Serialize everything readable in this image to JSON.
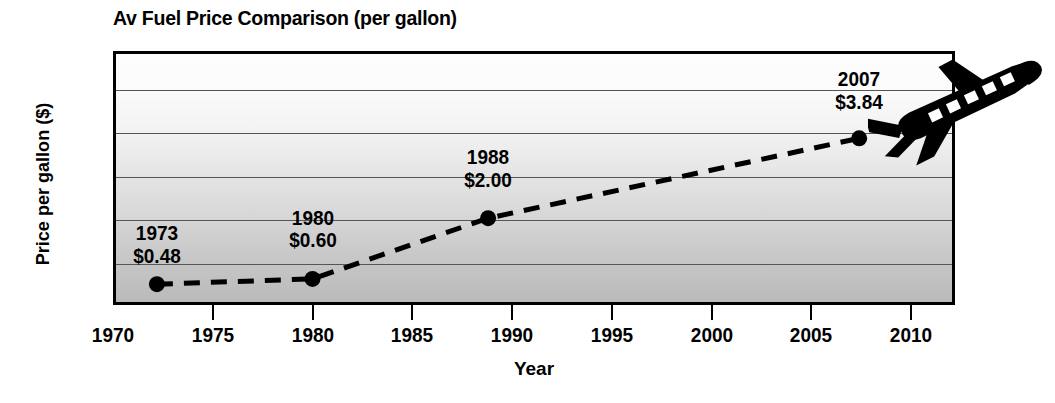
{
  "chart_data": {
    "type": "line",
    "title": "Av Fuel Price Comparison (per gallon)",
    "xlabel": "Year",
    "ylabel": "Price per gallon ($)",
    "xlim": [
      1970,
      2012.2
    ],
    "ylim": [
      0,
      5.85
    ],
    "grid": true,
    "legend": "none",
    "line_style": "dashed",
    "marker": "filled-circle",
    "series_color": "#000000",
    "x": [
      1972.2,
      1980.0,
      1988.8,
      2007.4
    ],
    "values": [
      0.48,
      0.6,
      2.0,
      3.84
    ],
    "categories": [
      "1973",
      "1980",
      "1988",
      "2007"
    ],
    "points": [
      {
        "year_label": "1973",
        "value_label": "$0.48",
        "x": 1972.2,
        "y": 0.48
      },
      {
        "year_label": "1980",
        "value_label": "$0.60",
        "x": 1980.0,
        "y": 0.6
      },
      {
        "year_label": "1988",
        "value_label": "$2.00",
        "x": 1988.8,
        "y": 2.0
      },
      {
        "year_label": "2007",
        "value_label": "$3.84",
        "x": 2007.4,
        "y": 3.84
      }
    ],
    "x_ticks": [
      1970,
      1975,
      1980,
      1985,
      1990,
      1995,
      2000,
      2005,
      2010
    ],
    "x_tick_labels": [
      "1970",
      "1975",
      "1980",
      "1985",
      "1990",
      "1995",
      "2000",
      "2005",
      "2010"
    ],
    "y_ticks": [
      0,
      1.0,
      2.0,
      3.0,
      4.0,
      5.0
    ],
    "y_tick_labels": [
      "0",
      "1.00",
      "2.00",
      "3.00",
      "4.00",
      "5.00"
    ],
    "gridline_values": [
      1.0,
      2.0,
      3.0,
      4.0,
      5.0
    ],
    "annotations": [
      {
        "label": "airplane-silhouette",
        "description": "black jet airplane silhouette at upper right"
      }
    ],
    "background": {
      "plot_gradient_top": "#fdfdfd",
      "plot_gradient_bottom": "#bababa",
      "gridline_color": "#555555",
      "frame_color": "#000000",
      "page_background": "#ffffff"
    }
  }
}
